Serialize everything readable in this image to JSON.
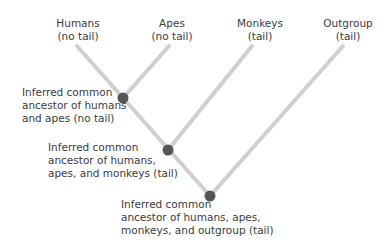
{
  "diagram": {
    "type": "phylogenetic-tree",
    "colors": {
      "branch": "#cfcfcf",
      "node": "#555555",
      "text": "#3c3c3c"
    },
    "taxa": [
      {
        "name": "Humans",
        "trait": "(no tail)"
      },
      {
        "name": "Apes",
        "trait": "(no tail)"
      },
      {
        "name": "Monkeys",
        "trait": "(tail)"
      },
      {
        "name": "Outgroup",
        "trait": "(tail)"
      }
    ],
    "nodes": [
      {
        "lines": [
          "Inferred common",
          "ancestor of humans",
          "and apes (no tail)"
        ]
      },
      {
        "lines": [
          "Inferred common",
          "ancestor of humans,",
          "apes, and monkeys (tail)"
        ]
      },
      {
        "lines": [
          "Inferred common",
          "ancestor of humans, apes,",
          "monkeys, and outgroup (tail)"
        ]
      }
    ]
  }
}
